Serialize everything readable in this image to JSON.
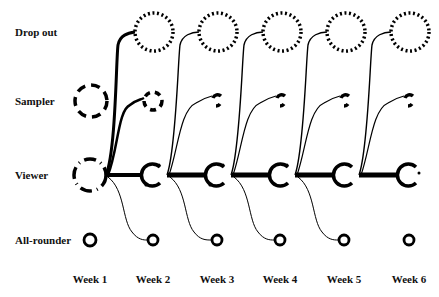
{
  "diagram": {
    "rows": [
      {
        "id": "dropout",
        "label": "Drop out",
        "y": 32
      },
      {
        "id": "sampler",
        "label": "Sampler",
        "y": 101
      },
      {
        "id": "viewer",
        "label": "Viewer",
        "y": 175
      },
      {
        "id": "allrounder",
        "label": "All-rounder",
        "y": 240
      }
    ],
    "weeks": [
      {
        "label": "Week 1",
        "x": 90
      },
      {
        "label": "Week 2",
        "x": 153
      },
      {
        "label": "Week 3",
        "x": 217
      },
      {
        "label": "Week 4",
        "x": 280
      },
      {
        "label": "Week 5",
        "x": 344
      },
      {
        "label": "Week 6",
        "x": 409
      }
    ],
    "node_styles": {
      "dropout": "dotted",
      "sampler": "dashed",
      "viewer": "dash-dot",
      "allrounder": "solid"
    },
    "colors": {
      "ink": "#000000",
      "background": "#ffffff"
    }
  }
}
